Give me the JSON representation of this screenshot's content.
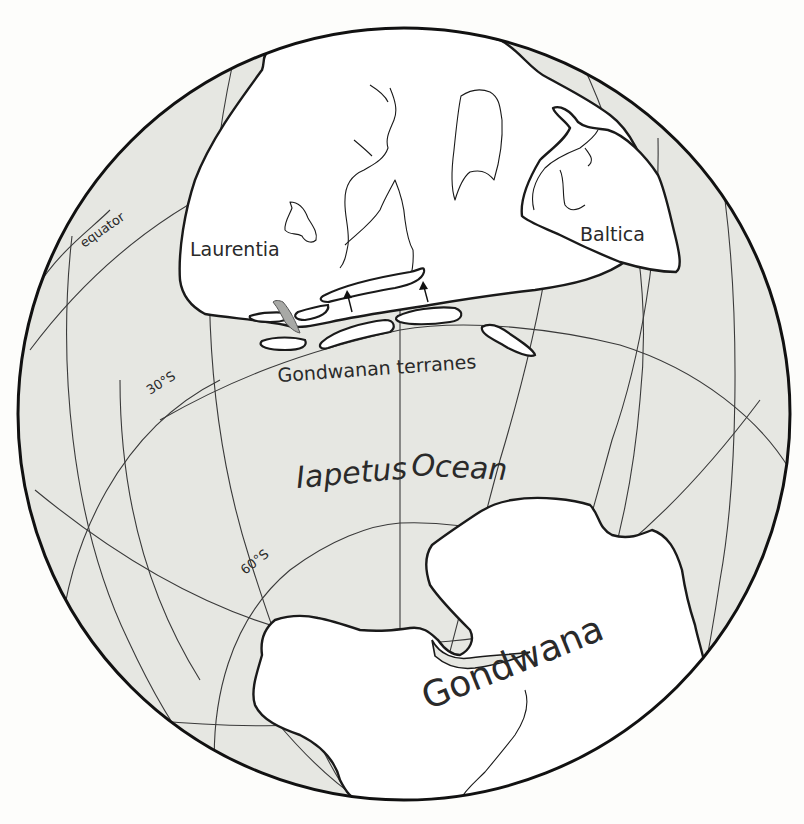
{
  "map": {
    "projection": "orthographic globe",
    "colors": {
      "ocean": "#e6e7e2",
      "land": "#ffffff",
      "outline": "#1a1a1a",
      "accent_wedge": "#a8a9a6"
    },
    "labels": {
      "equator": "equator",
      "lat_30s": "30°S",
      "lat_60s": "60°S",
      "laurentia": "Laurentia",
      "baltica": "Baltica",
      "gondwanan_terranes": "Gondwanan terranes",
      "iapetus": "Iapetus",
      "ocean": "Ocean",
      "gondwana": "Gondwana"
    },
    "landmasses": [
      {
        "name": "Laurentia"
      },
      {
        "name": "Baltica"
      },
      {
        "name": "Gondwana"
      },
      {
        "name": "Gondwanan terranes",
        "count": 7
      }
    ],
    "arrows": [
      {
        "direction": "north",
        "meaning": "terrane motion toward Laurentia"
      },
      {
        "direction": "north",
        "meaning": "terrane motion toward Laurentia"
      }
    ]
  }
}
